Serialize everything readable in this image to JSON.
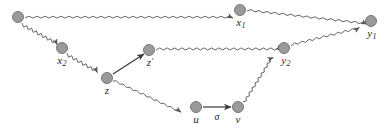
{
  "diagram": {
    "background_color": "#ffffff",
    "node_fill_color": "#9a9a9a",
    "node_stroke_color": "#6f6f6f",
    "edge_color": "#555555",
    "label_color": "#2b2b2b",
    "node_radius": 5.5,
    "nodes": [
      {
        "id": "origin",
        "label": "",
        "base": "",
        "sub": "",
        "prime": false,
        "cx": 18,
        "cy": 17,
        "label_x": 18,
        "label_y": 28
      },
      {
        "id": "x1",
        "label": "x1",
        "base": "x",
        "sub": "1",
        "prime": false,
        "cx": 240,
        "cy": 10,
        "label_x": 241,
        "label_y": 17
      },
      {
        "id": "y1",
        "label": "y1",
        "base": "y",
        "sub": "1",
        "prime": false,
        "cx": 371,
        "cy": 21,
        "label_x": 372,
        "label_y": 28
      },
      {
        "id": "x2",
        "label": "x2",
        "base": "x",
        "sub": "2",
        "prime": false,
        "cx": 62,
        "cy": 48,
        "label_x": 62,
        "label_y": 55
      },
      {
        "id": "zprime",
        "label": "z'",
        "base": "z",
        "sub": "",
        "prime": true,
        "cx": 149,
        "cy": 50,
        "label_x": 150,
        "label_y": 57
      },
      {
        "id": "y2",
        "label": "y2",
        "base": "y",
        "sub": "2",
        "prime": false,
        "cx": 284,
        "cy": 48,
        "label_x": 286,
        "label_y": 55
      },
      {
        "id": "z",
        "label": "z",
        "base": "z",
        "sub": "",
        "prime": false,
        "cx": 107,
        "cy": 78,
        "label_x": 107,
        "label_y": 85
      },
      {
        "id": "u",
        "label": "u",
        "base": "u",
        "sub": "",
        "prime": false,
        "cx": 196,
        "cy": 107,
        "label_x": 196,
        "label_y": 114
      },
      {
        "id": "v",
        "label": "v",
        "base": "v",
        "sub": "",
        "prime": false,
        "cx": 238,
        "cy": 107,
        "label_x": 238,
        "label_y": 114
      }
    ],
    "edges": [
      {
        "id": "origin-to-x1",
        "from": "origin",
        "to": "x1",
        "style": "wavy",
        "label": "",
        "arrowhead": true
      },
      {
        "id": "x1-to-y1",
        "from": "x1",
        "to": "y1",
        "style": "wavy",
        "label": "",
        "arrowhead": true
      },
      {
        "id": "origin-to-x2",
        "from": "origin",
        "to": "x2",
        "style": "wavy",
        "label": "",
        "arrowhead": true
      },
      {
        "id": "x2-to-z",
        "from": "x2",
        "to": "z",
        "style": "wavy",
        "label": "",
        "arrowhead": true
      },
      {
        "id": "z-to-zprime",
        "from": "z",
        "to": "zprime",
        "style": "straight",
        "label": "",
        "arrowhead": true
      },
      {
        "id": "zprime-to-y2",
        "from": "zprime",
        "to": "y2",
        "style": "wavy",
        "label": "",
        "arrowhead": true
      },
      {
        "id": "y2-to-y1",
        "from": "y2",
        "to": "y1",
        "style": "wavy",
        "label": "",
        "arrowhead": true
      },
      {
        "id": "z-to-u",
        "from": "z",
        "to": "u",
        "style": "wavy",
        "label": "",
        "arrowhead": true
      },
      {
        "id": "u-to-v",
        "from": "u",
        "to": "v",
        "style": "straight",
        "label": "sigma",
        "arrowhead": true
      },
      {
        "id": "v-to-y2",
        "from": "v",
        "to": "y2",
        "style": "wavy",
        "label": "",
        "arrowhead": true
      }
    ],
    "edge_labels": [
      {
        "id": "sigma-label",
        "text": "σ",
        "x": 217,
        "y": 112
      }
    ]
  }
}
